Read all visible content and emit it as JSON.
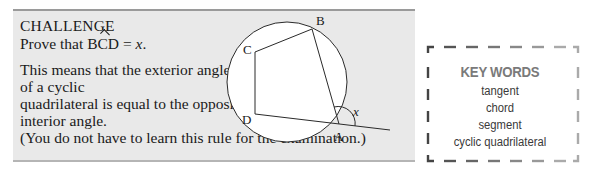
{
  "challenge": {
    "heading": "CHALLENGE",
    "prove_prefix": "Prove that ",
    "angle_name_pre": "B",
    "angle_name_hat": "C",
    "angle_name_post": "D",
    "prove_equals": " = ",
    "prove_var": "x",
    "prove_end": ".",
    "lines": [
      "This means that the exterior angle",
      "of a cyclic",
      "quadrilateral is equal to the opposite",
      "interior angle.",
      "(You do not have to learn this rule for the examination.)"
    ]
  },
  "diagram": {
    "points": {
      "A": "A",
      "B": "B",
      "C": "C",
      "D": "D"
    },
    "angle_label": "x"
  },
  "key_words": {
    "title": "KEY WORDS",
    "items": [
      "tangent",
      "chord",
      "segment",
      "cyclic quadrilateral"
    ]
  },
  "colors": {
    "box_bg": "#e9e9e9",
    "text": "#1a1a1a",
    "key_title": "#7a7a7a"
  }
}
